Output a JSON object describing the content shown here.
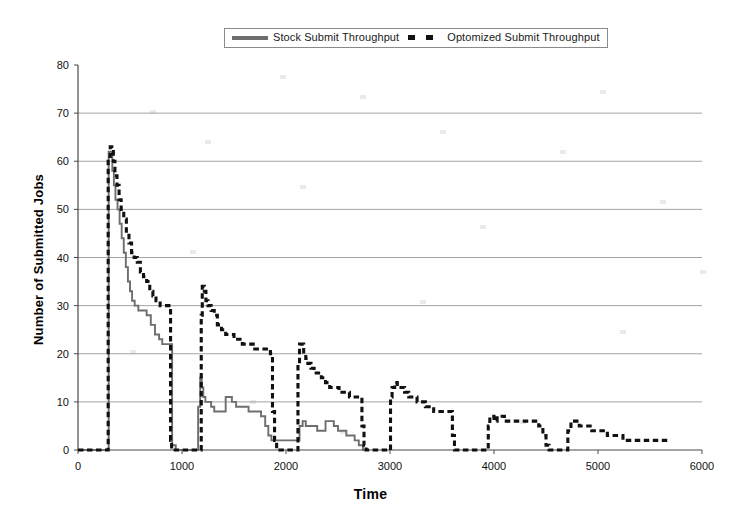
{
  "legend": {
    "position": "top-center",
    "entries": [
      {
        "label": "Stock Submit Throughput",
        "style": "solid",
        "color": "#6e6e6e",
        "icon": "line-swatch-icon"
      },
      {
        "label": "Optomized Submit Throughput",
        "style": "dashed",
        "color": "#111111",
        "icon": "dash-swatch-icon"
      }
    ]
  },
  "axes": {
    "x": {
      "label": "Time",
      "min": 0,
      "max": 6000,
      "step": 1000,
      "ticks": [
        "0",
        "1000",
        "2000",
        "3000",
        "4000",
        "5000",
        "6000"
      ]
    },
    "y": {
      "label": "Number of Submitted Jobs",
      "min": 0,
      "max": 80,
      "step": 10,
      "ticks": [
        "0",
        "10",
        "20",
        "30",
        "40",
        "50",
        "60",
        "70",
        "80"
      ]
    }
  },
  "chart_data": {
    "type": "line",
    "title": "",
    "subtitle": "",
    "xlabel": "Time",
    "ylabel": "Number of Submitted Jobs",
    "xlim": [
      0,
      6000
    ],
    "ylim": [
      0,
      80
    ],
    "grid": "horizontal",
    "legend_position": "top-center",
    "annotations": [],
    "series": [
      {
        "name": "Stock Submit Throughput",
        "color": "#6e6e6e",
        "style": "solid",
        "interpolation": "step",
        "points": [
          [
            0,
            0
          ],
          [
            290,
            0
          ],
          [
            295,
            62
          ],
          [
            320,
            62
          ],
          [
            330,
            58
          ],
          [
            345,
            55
          ],
          [
            360,
            52
          ],
          [
            380,
            50
          ],
          [
            400,
            47
          ],
          [
            420,
            44
          ],
          [
            440,
            41
          ],
          [
            460,
            38
          ],
          [
            480,
            35
          ],
          [
            500,
            33
          ],
          [
            520,
            31
          ],
          [
            545,
            30
          ],
          [
            580,
            29
          ],
          [
            620,
            29
          ],
          [
            660,
            28
          ],
          [
            700,
            26
          ],
          [
            740,
            24
          ],
          [
            780,
            23
          ],
          [
            810,
            22
          ],
          [
            860,
            22
          ],
          [
            900,
            22
          ],
          [
            905,
            1
          ],
          [
            940,
            0
          ],
          [
            1150,
            0
          ],
          [
            1155,
            9
          ],
          [
            1175,
            15
          ],
          [
            1190,
            13
          ],
          [
            1205,
            11
          ],
          [
            1225,
            10
          ],
          [
            1250,
            10
          ],
          [
            1280,
            9
          ],
          [
            1310,
            8
          ],
          [
            1340,
            8
          ],
          [
            1380,
            8
          ],
          [
            1420,
            11
          ],
          [
            1450,
            11
          ],
          [
            1480,
            10
          ],
          [
            1520,
            9
          ],
          [
            1560,
            9
          ],
          [
            1600,
            9
          ],
          [
            1640,
            8
          ],
          [
            1680,
            8
          ],
          [
            1720,
            8
          ],
          [
            1760,
            7
          ],
          [
            1800,
            5
          ],
          [
            1830,
            3
          ],
          [
            1860,
            2
          ],
          [
            1900,
            2
          ],
          [
            1960,
            2
          ],
          [
            2040,
            2
          ],
          [
            2100,
            2
          ],
          [
            2130,
            5
          ],
          [
            2160,
            6
          ],
          [
            2190,
            5
          ],
          [
            2220,
            5
          ],
          [
            2260,
            5
          ],
          [
            2300,
            4
          ],
          [
            2340,
            4
          ],
          [
            2380,
            6
          ],
          [
            2420,
            6
          ],
          [
            2460,
            5
          ],
          [
            2500,
            4
          ],
          [
            2540,
            4
          ],
          [
            2580,
            3
          ],
          [
            2620,
            3
          ],
          [
            2660,
            2
          ],
          [
            2700,
            1
          ],
          [
            2740,
            0
          ],
          [
            2760,
            0
          ]
        ]
      },
      {
        "name": "Optomized Submit Throughput",
        "color": "#111111",
        "style": "dashed",
        "interpolation": "step",
        "points": [
          [
            0,
            0
          ],
          [
            285,
            0
          ],
          [
            290,
            61
          ],
          [
            310,
            63
          ],
          [
            325,
            62
          ],
          [
            340,
            60
          ],
          [
            355,
            57
          ],
          [
            375,
            55
          ],
          [
            395,
            52
          ],
          [
            415,
            50
          ],
          [
            440,
            48
          ],
          [
            465,
            45
          ],
          [
            490,
            43
          ],
          [
            515,
            41
          ],
          [
            540,
            40
          ],
          [
            570,
            39
          ],
          [
            600,
            37
          ],
          [
            630,
            36
          ],
          [
            660,
            35
          ],
          [
            690,
            33
          ],
          [
            720,
            32
          ],
          [
            750,
            31
          ],
          [
            790,
            30
          ],
          [
            840,
            30
          ],
          [
            880,
            30
          ],
          [
            890,
            2
          ],
          [
            900,
            0
          ],
          [
            1180,
            0
          ],
          [
            1185,
            28
          ],
          [
            1195,
            34
          ],
          [
            1215,
            33
          ],
          [
            1230,
            31
          ],
          [
            1250,
            30
          ],
          [
            1280,
            29
          ],
          [
            1310,
            28
          ],
          [
            1340,
            26
          ],
          [
            1380,
            25
          ],
          [
            1420,
            24
          ],
          [
            1460,
            24
          ],
          [
            1500,
            23
          ],
          [
            1540,
            23
          ],
          [
            1580,
            22
          ],
          [
            1620,
            22
          ],
          [
            1660,
            22
          ],
          [
            1700,
            21
          ],
          [
            1750,
            21
          ],
          [
            1800,
            21
          ],
          [
            1850,
            20
          ],
          [
            1870,
            8
          ],
          [
            1890,
            2
          ],
          [
            1910,
            0
          ],
          [
            2110,
            0
          ],
          [
            2115,
            18
          ],
          [
            2130,
            22
          ],
          [
            2150,
            22
          ],
          [
            2170,
            20
          ],
          [
            2190,
            19
          ],
          [
            2210,
            18
          ],
          [
            2240,
            17
          ],
          [
            2270,
            16
          ],
          [
            2300,
            16
          ],
          [
            2340,
            15
          ],
          [
            2380,
            14
          ],
          [
            2420,
            13
          ],
          [
            2460,
            13
          ],
          [
            2510,
            12
          ],
          [
            2560,
            12
          ],
          [
            2610,
            11
          ],
          [
            2660,
            11
          ],
          [
            2700,
            11
          ],
          [
            2730,
            5
          ],
          [
            2750,
            1
          ],
          [
            2770,
            0
          ],
          [
            3000,
            0
          ],
          [
            3005,
            11
          ],
          [
            3020,
            13
          ],
          [
            3045,
            14
          ],
          [
            3070,
            13
          ],
          [
            3100,
            13
          ],
          [
            3140,
            12
          ],
          [
            3180,
            11
          ],
          [
            3220,
            11
          ],
          [
            3260,
            10
          ],
          [
            3300,
            10
          ],
          [
            3340,
            9
          ],
          [
            3380,
            9
          ],
          [
            3420,
            8
          ],
          [
            3470,
            8
          ],
          [
            3520,
            8
          ],
          [
            3570,
            8
          ],
          [
            3600,
            3
          ],
          [
            3620,
            0
          ],
          [
            3940,
            0
          ],
          [
            3945,
            5
          ],
          [
            3960,
            7
          ],
          [
            3985,
            7
          ],
          [
            4000,
            6
          ],
          [
            4030,
            7
          ],
          [
            4060,
            7
          ],
          [
            4100,
            6
          ],
          [
            4150,
            6
          ],
          [
            4200,
            6
          ],
          [
            4260,
            6
          ],
          [
            4320,
            6
          ],
          [
            4380,
            6
          ],
          [
            4430,
            5
          ],
          [
            4470,
            3
          ],
          [
            4500,
            1
          ],
          [
            4530,
            0
          ],
          [
            4700,
            0
          ],
          [
            4710,
            4
          ],
          [
            4740,
            6
          ],
          [
            4780,
            6
          ],
          [
            4820,
            5
          ],
          [
            4860,
            5
          ],
          [
            4900,
            5
          ],
          [
            4940,
            4
          ],
          [
            4990,
            4
          ],
          [
            5040,
            4
          ],
          [
            5090,
            3
          ],
          [
            5140,
            3
          ],
          [
            5190,
            3
          ],
          [
            5240,
            2
          ],
          [
            5300,
            2
          ],
          [
            5360,
            2
          ],
          [
            5420,
            2
          ],
          [
            5480,
            2
          ],
          [
            5540,
            2
          ],
          [
            5600,
            2
          ],
          [
            5660,
            2
          ],
          [
            5700,
            2
          ]
        ]
      }
    ]
  }
}
